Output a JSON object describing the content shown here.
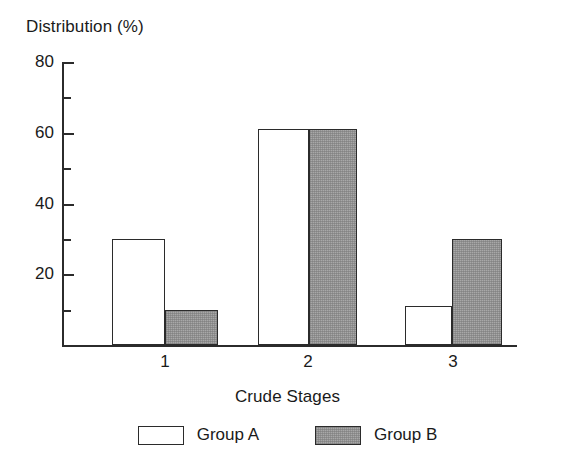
{
  "chart_data": {
    "type": "bar",
    "title": "",
    "ylabel": "Distribution (%)",
    "xlabel": "Crude Stages",
    "categories": [
      "1",
      "2",
      "3"
    ],
    "series": [
      {
        "name": "Group A",
        "values": [
          30,
          61,
          11
        ],
        "color": "#ffffff"
      },
      {
        "name": "Group B",
        "values": [
          10,
          61,
          30
        ],
        "color": "#a8a8a8"
      }
    ],
    "ylim": [
      0,
      80
    ],
    "y_major_ticks": [
      0,
      20,
      40,
      60,
      80
    ],
    "y_major_tick_labels": [
      "",
      "20",
      "40",
      "60",
      "80"
    ],
    "y_minor_ticks": [
      10,
      30,
      50,
      70
    ],
    "grid": false,
    "legend_position": "bottom",
    "legend_entries": [
      "Group A",
      "Group B"
    ]
  },
  "axes": {
    "y_title": "Distribution (%)",
    "x_title": "Crude Stages",
    "y_labels": [
      "80",
      "60",
      "40",
      "20"
    ],
    "x_labels": [
      "1",
      "2",
      "3"
    ]
  },
  "legend": {
    "items": [
      {
        "label": "Group A",
        "swatch": "white-bar-swatch"
      },
      {
        "label": "Group B",
        "swatch": "gray-bar-swatch"
      }
    ]
  }
}
